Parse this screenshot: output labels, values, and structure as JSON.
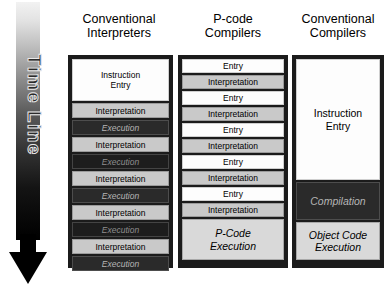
{
  "timeline": {
    "label": "Time Line",
    "arrow_direction": "down",
    "gradient_from": "#f2f2f2",
    "gradient_to": "#000000"
  },
  "columns": [
    {
      "id": "conventional-interpreters",
      "heading": "Conventional\nInterpreters",
      "blocks": [
        {
          "label": "Instruction\nEntry",
          "style": "white",
          "height": 42
        },
        {
          "label": "Interpretation",
          "style": "light",
          "height": 15
        },
        {
          "label": "Execution",
          "style": "dark",
          "height": 15
        },
        {
          "label": "Interpretation",
          "style": "light",
          "height": 15
        },
        {
          "label": "Execution",
          "style": "darker",
          "height": 15
        },
        {
          "label": "Interpretation",
          "style": "light",
          "height": 15
        },
        {
          "label": "Execution",
          "style": "dark",
          "height": 15
        },
        {
          "label": "Interpretation",
          "style": "light",
          "height": 15
        },
        {
          "label": "Execution",
          "style": "darker",
          "height": 15
        },
        {
          "label": "Interpretation",
          "style": "light",
          "height": 15
        },
        {
          "label": "Execution",
          "style": "dark",
          "height": 15
        }
      ]
    },
    {
      "id": "p-code-compilers",
      "heading": "P-code\nCompilers",
      "blocks": [
        {
          "label": "Entry",
          "style": "white",
          "height": 14
        },
        {
          "label": "Interpretation",
          "style": "light",
          "height": 14
        },
        {
          "label": "Entry",
          "style": "white",
          "height": 14
        },
        {
          "label": "Interpretation",
          "style": "light",
          "height": 14
        },
        {
          "label": "Entry",
          "style": "white",
          "height": 14
        },
        {
          "label": "Interpretation",
          "style": "light",
          "height": 14
        },
        {
          "label": "Entry",
          "style": "white",
          "height": 14
        },
        {
          "label": "Interpretation",
          "style": "light",
          "height": 14
        },
        {
          "label": "Entry",
          "style": "white",
          "height": 14
        },
        {
          "label": "Interpretation",
          "style": "light",
          "height": 14
        },
        {
          "label": "P-Code\nExecution",
          "style": "lighter",
          "height": 41,
          "italic": true,
          "big": true
        }
      ]
    },
    {
      "id": "conventional-compilers",
      "heading": "Conventional\nCompilers",
      "blocks": [
        {
          "label": "Instruction\nEntry",
          "style": "white",
          "height": 121,
          "big": true
        },
        {
          "label": "Compilation",
          "style": "dark",
          "height": 38,
          "big": true
        },
        {
          "label": "Object Code\nExecution",
          "style": "lighter",
          "height": 38,
          "italic": true,
          "big": true
        }
      ]
    }
  ]
}
